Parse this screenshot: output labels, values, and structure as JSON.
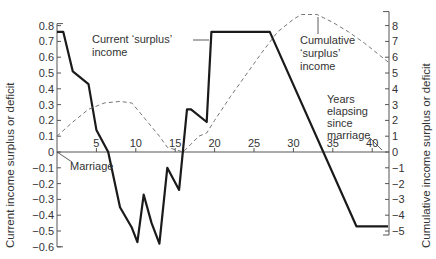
{
  "chart_data": {
    "type": "line",
    "title": "",
    "xlabel": "Years elapsing since marriage",
    "ylabel_left": "Current income surplus or deficit",
    "ylabel_right": "Cumulative income surplus or deficit",
    "xlim": [
      0,
      42
    ],
    "ylim_left": [
      -0.6,
      0.8
    ],
    "ylim_right": [
      -5,
      8
    ],
    "x_ticks": [
      0,
      5,
      10,
      15,
      20,
      25,
      30,
      35,
      40
    ],
    "x_tick_labels": [
      "0",
      "5",
      "10",
      "15",
      "20",
      "25",
      "30",
      "35",
      "40"
    ],
    "y_left_ticks": [
      0.8,
      0.7,
      0.6,
      0.5,
      0.4,
      0.3,
      0.2,
      0.1,
      0,
      -0.1,
      -0.2,
      -0.3,
      -0.4,
      -0.5,
      -0.6
    ],
    "y_left_tick_labels": [
      "0.8",
      "0.7",
      "0.6",
      "0.5",
      "0.4",
      "0.3",
      "0.2",
      "0.1",
      "0",
      "−0.1",
      "−0.2",
      "−0.3",
      "−0.4",
      "−0.5",
      "−0.6"
    ],
    "y_right_ticks": [
      8,
      7,
      6,
      5,
      4,
      3,
      2,
      1,
      0,
      -1,
      -2,
      -3,
      -4,
      -5
    ],
    "y_right_tick_labels": [
      "8",
      "7",
      "6",
      "5",
      "4",
      "3",
      "2",
      "1",
      "0",
      "−1",
      "−2",
      "−3",
      "−4",
      "−5"
    ],
    "grid": false,
    "legend": "none (direct annotations)",
    "series": [
      {
        "name": "Current 'surplus' income",
        "axis": "left",
        "style": "solid-thick",
        "x": [
          0,
          0.8,
          2,
          4,
          5,
          6.5,
          8,
          9.5,
          10.2,
          11,
          12,
          13,
          14,
          15.5,
          16.5,
          17,
          19,
          19.6,
          27,
          38,
          42
        ],
        "y": [
          0.76,
          0.76,
          0.51,
          0.43,
          0.14,
          0.0,
          -0.35,
          -0.48,
          -0.57,
          -0.27,
          -0.45,
          -0.58,
          -0.1,
          -0.24,
          0.27,
          0.27,
          0.19,
          0.76,
          0.76,
          -0.47,
          -0.47
        ]
      },
      {
        "name": "Cumulative 'surplus' income",
        "axis": "right",
        "style": "dashed-thin",
        "x": [
          0,
          2,
          4,
          6,
          8,
          9.5,
          11,
          13,
          14,
          16,
          17,
          18,
          19,
          20,
          22,
          24,
          26,
          28,
          30,
          31,
          33,
          35,
          37,
          39,
          41,
          42
        ],
        "y": [
          1.0,
          1.9,
          2.7,
          3.1,
          3.2,
          3.1,
          2.2,
          1.0,
          0.3,
          0.0,
          0.5,
          1.0,
          1.2,
          2.0,
          3.5,
          4.9,
          6.3,
          7.6,
          8.4,
          8.7,
          8.7,
          8.2,
          7.6,
          6.9,
          6.1,
          5.7
        ]
      }
    ],
    "annotations": [
      {
        "text": "Current 'surplus' income",
        "points_to": "Current 'surplus' income",
        "at_x": 19.6
      },
      {
        "text": "Cumulative 'surplus' income",
        "points_to": "Cumulative 'surplus' income",
        "at_x": 32
      },
      {
        "text": "Marriage",
        "points_to": "origin",
        "at_x": 0
      },
      {
        "text": "Years elapsing since marriage",
        "points_to": "x-axis end",
        "at_x": 42
      }
    ]
  },
  "labels": {
    "ylabel_left": "Current income surplus or deficit",
    "ylabel_right": "Cumulative income surplus or deficit",
    "current_line1": "Current ‘surplus’",
    "current_line2": "income",
    "cumulative_line1": "Cumulative",
    "cumulative_line2": "‘surplus’",
    "cumulative_line3": "income",
    "marriage": "Marriage",
    "years_line1": "Years",
    "years_line2": "elapsing",
    "years_line3": "since",
    "years_line4": "marriage"
  }
}
